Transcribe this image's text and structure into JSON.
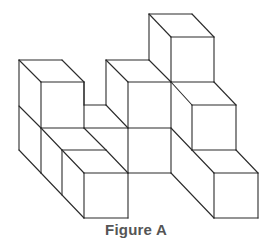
{
  "figure": {
    "caption": "Figure A",
    "line_color": "#2b2b2b",
    "caption_color": "#555555",
    "segments": [
      [
        19,
        60,
        62,
        60
      ],
      [
        19,
        60,
        41,
        82
      ],
      [
        62,
        60,
        84,
        82
      ],
      [
        41,
        82,
        84,
        82
      ],
      [
        41,
        82,
        41,
        128
      ],
      [
        84,
        82,
        84,
        128
      ],
      [
        19,
        60,
        19,
        150
      ],
      [
        19,
        106,
        41,
        128
      ],
      [
        41,
        128,
        84,
        128
      ],
      [
        84,
        128,
        128,
        128
      ],
      [
        84,
        105,
        106,
        105
      ],
      [
        84,
        105,
        84,
        82
      ],
      [
        19,
        150,
        41,
        173
      ],
      [
        41,
        128,
        41,
        173
      ],
      [
        41,
        128,
        62,
        150
      ],
      [
        62,
        150,
        106,
        150
      ],
      [
        84,
        128,
        106,
        150
      ],
      [
        41,
        173,
        84,
        218
      ],
      [
        62,
        150,
        62,
        195
      ],
      [
        62,
        150,
        84,
        173
      ],
      [
        84,
        173,
        128,
        173
      ],
      [
        106,
        150,
        128,
        173
      ],
      [
        84,
        173,
        84,
        218
      ],
      [
        128,
        173,
        128,
        218
      ],
      [
        84,
        218,
        128,
        218
      ],
      [
        106,
        60,
        149,
        60
      ],
      [
        106,
        60,
        128,
        82
      ],
      [
        106,
        60,
        106,
        105
      ],
      [
        106,
        105,
        128,
        128
      ],
      [
        128,
        82,
        171,
        82
      ],
      [
        128,
        82,
        128,
        173
      ],
      [
        171,
        82,
        171,
        173
      ],
      [
        128,
        128,
        171,
        128
      ],
      [
        128,
        173,
        171,
        173
      ],
      [
        149,
        60,
        171,
        82
      ],
      [
        149,
        14,
        192,
        14
      ],
      [
        149,
        14,
        171,
        37
      ],
      [
        192,
        14,
        214,
        37
      ],
      [
        171,
        37,
        214,
        37
      ],
      [
        171,
        37,
        171,
        82
      ],
      [
        214,
        37,
        214,
        82
      ],
      [
        149,
        14,
        149,
        60
      ],
      [
        171,
        82,
        214,
        82
      ],
      [
        214,
        82,
        236,
        105
      ],
      [
        171,
        82,
        192,
        105
      ],
      [
        192,
        105,
        236,
        105
      ],
      [
        192,
        105,
        192,
        150
      ],
      [
        236,
        105,
        236,
        150
      ],
      [
        171,
        128,
        192,
        150
      ],
      [
        171,
        173,
        214,
        218
      ],
      [
        192,
        150,
        236,
        150
      ],
      [
        236,
        150,
        258,
        173
      ],
      [
        192,
        150,
        214,
        173
      ],
      [
        214,
        173,
        258,
        173
      ],
      [
        214,
        173,
        214,
        218
      ],
      [
        258,
        173,
        258,
        218
      ],
      [
        214,
        218,
        258,
        218
      ]
    ]
  }
}
